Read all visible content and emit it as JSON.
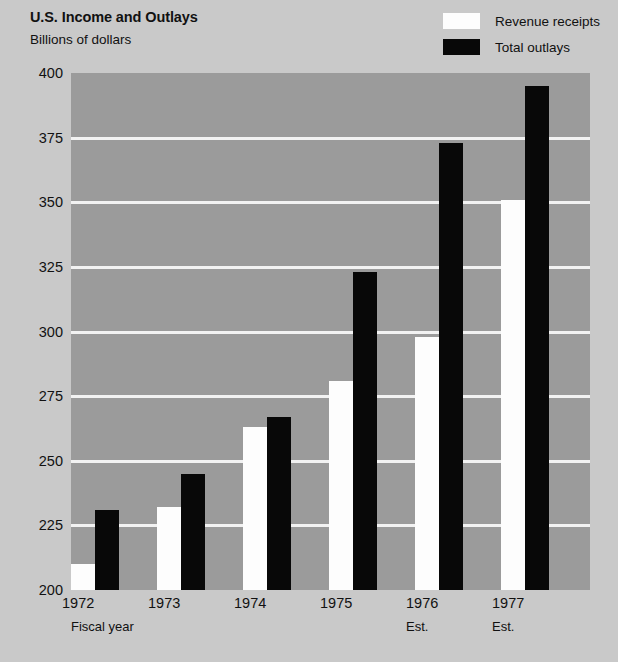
{
  "header": {
    "title": "U.S. Income and Outlays",
    "subtitle": "Billions of dollars"
  },
  "legend": {
    "position": "top-right",
    "items": [
      {
        "label": "Revenue receipts",
        "color": "#fdfdfd",
        "swatch": "revenue-swatch"
      },
      {
        "label": "Total outlays",
        "color": "#080808",
        "swatch": "outlays-swatch"
      }
    ]
  },
  "axis": {
    "x_axis_label": "Fiscal year",
    "estimate_note": "Est.",
    "y_ticks": [
      "400",
      "375",
      "350",
      "325",
      "300",
      "275",
      "250",
      "225",
      "200"
    ]
  },
  "colors": {
    "page_background": "#c9c9c9",
    "plot_background": "#9b9b9b",
    "gridline": "#f2f2f2",
    "revenue": "#fdfdfd",
    "outlays": "#080808",
    "text": "#111111"
  },
  "chart_data": {
    "type": "bar",
    "title": "U.S. Income and Outlays",
    "subtitle": "Billions of dollars",
    "xlabel": "Fiscal year",
    "ylabel": "Billions of dollars",
    "ylim": [
      200,
      400
    ],
    "ytick_step": 25,
    "yticks": [
      200,
      225,
      250,
      275,
      300,
      325,
      350,
      375,
      400
    ],
    "grid": true,
    "legend_position": "top-right",
    "categories": [
      "1972",
      "1973",
      "1974",
      "1975",
      "1976",
      "1977"
    ],
    "category_notes": [
      "",
      "",
      "",
      "",
      "Est.",
      "Est."
    ],
    "series": [
      {
        "name": "Revenue receipts",
        "color": "#fdfdfd",
        "values": [
          210,
          232,
          263,
          281,
          298,
          351
        ]
      },
      {
        "name": "Total outlays",
        "color": "#080808",
        "values": [
          231,
          245,
          267,
          323,
          373,
          395
        ]
      }
    ]
  }
}
